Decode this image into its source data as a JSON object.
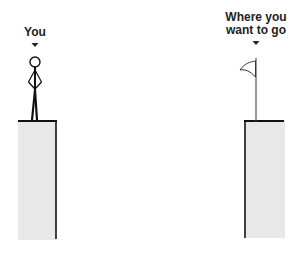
{
  "labels": {
    "you": "You",
    "goal_line1": "Where you",
    "goal_line2": "want to go"
  },
  "colors": {
    "cliff_fill": "#e8e8e8",
    "ink": "#111111",
    "background": "#ffffff"
  },
  "figure": {
    "left_cliff": {
      "x": 18,
      "y": 120,
      "width": 38,
      "height": 120
    },
    "right_cliff": {
      "x": 245,
      "y": 120,
      "width": 40,
      "height": 118
    }
  }
}
